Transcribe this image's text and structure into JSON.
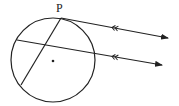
{
  "diagram": {
    "type": "geometry",
    "labels": {
      "point_p": "P"
    },
    "colors": {
      "stroke": "#222222",
      "background": "#ffffff"
    },
    "circle": {
      "cx": 53,
      "cy": 60,
      "r": 42
    },
    "center_dot": {
      "x": 53,
      "y": 61
    },
    "chord": {
      "from": [
        61,
        18
      ],
      "to": [
        21,
        85
      ]
    },
    "tangent_line": {
      "from": [
        61,
        18
      ],
      "to": [
        168,
        38
      ],
      "parallel_mark": "double-arrow"
    },
    "secant_line": {
      "from": [
        17,
        40
      ],
      "to": [
        162,
        65
      ],
      "parallel_mark": "double-arrow"
    }
  }
}
